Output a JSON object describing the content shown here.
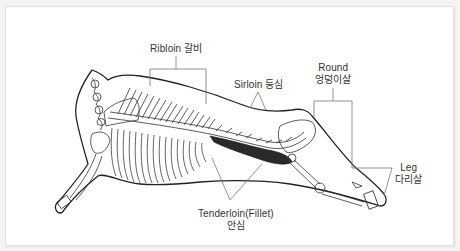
{
  "diagram": {
    "colors": {
      "background": "#f4f4f4",
      "panel": "#ffffff",
      "outline": "#222222",
      "leader_lines": "#777777",
      "muscle_fill": "#2a2a2a",
      "label_text": "#333333"
    },
    "labels": {
      "ribloin": {
        "en": "Ribloin",
        "ko": "갈비"
      },
      "sirloin": {
        "en": "Sirloin",
        "ko": "등심"
      },
      "round": {
        "en": "Round",
        "ko": "엉덩이살"
      },
      "leg": {
        "en": "Leg",
        "ko": "다리살"
      },
      "tenderloin": {
        "en": "Tenderloin(Fillet)",
        "ko": "안심"
      }
    }
  }
}
